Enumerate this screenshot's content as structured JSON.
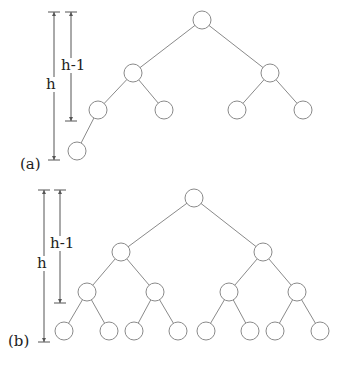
{
  "diagrams": [
    {
      "id": "a",
      "caption": "(a)",
      "height_label": "h",
      "height_minus_one_label": "h-1",
      "node_radius": 9,
      "nodes": [
        {
          "x": 202,
          "y": 20
        },
        {
          "x": 133,
          "y": 73
        },
        {
          "x": 270,
          "y": 73
        },
        {
          "x": 98,
          "y": 110
        },
        {
          "x": 164,
          "y": 110
        },
        {
          "x": 237,
          "y": 110
        },
        {
          "x": 303,
          "y": 110
        },
        {
          "x": 77,
          "y": 151
        }
      ],
      "edges": [
        [
          0,
          1
        ],
        [
          0,
          2
        ],
        [
          1,
          3
        ],
        [
          1,
          4
        ],
        [
          2,
          5
        ],
        [
          2,
          6
        ],
        [
          3,
          7
        ]
      ],
      "measure_h": {
        "x": 54,
        "y1": 12,
        "y2": 160
      },
      "measure_h1": {
        "x": 71,
        "y1": 12,
        "y2": 121
      },
      "caption_pos": {
        "x": 20,
        "y": 157
      },
      "h_label_pos": {
        "x": 46,
        "y": 77
      },
      "h1_label_pos": {
        "x": 61,
        "y": 58
      }
    },
    {
      "id": "b",
      "caption": "(b)",
      "height_label": "h",
      "height_minus_one_label": "h-1",
      "node_radius": 9,
      "nodes": [
        {
          "x": 194,
          "y": 198
        },
        {
          "x": 121,
          "y": 252
        },
        {
          "x": 263,
          "y": 252
        },
        {
          "x": 87,
          "y": 292
        },
        {
          "x": 155,
          "y": 292
        },
        {
          "x": 229,
          "y": 292
        },
        {
          "x": 297,
          "y": 292
        },
        {
          "x": 64,
          "y": 331
        },
        {
          "x": 109,
          "y": 331
        },
        {
          "x": 134,
          "y": 331
        },
        {
          "x": 178,
          "y": 331
        },
        {
          "x": 206,
          "y": 331
        },
        {
          "x": 250,
          "y": 331
        },
        {
          "x": 275,
          "y": 331
        },
        {
          "x": 320,
          "y": 331
        }
      ],
      "edges": [
        [
          0,
          1
        ],
        [
          0,
          2
        ],
        [
          1,
          3
        ],
        [
          1,
          4
        ],
        [
          2,
          5
        ],
        [
          2,
          6
        ],
        [
          3,
          7
        ],
        [
          3,
          8
        ],
        [
          4,
          9
        ],
        [
          4,
          10
        ],
        [
          5,
          11
        ],
        [
          5,
          12
        ],
        [
          6,
          13
        ],
        [
          6,
          14
        ]
      ],
      "measure_h": {
        "x": 44,
        "y1": 190,
        "y2": 342
      },
      "measure_h1": {
        "x": 60,
        "y1": 190,
        "y2": 303
      },
      "caption_pos": {
        "x": 8,
        "y": 334
      },
      "h_label_pos": {
        "x": 37,
        "y": 256
      },
      "h1_label_pos": {
        "x": 50,
        "y": 236
      }
    }
  ],
  "colors": {
    "stroke": "#8a8a8a",
    "node_fill": "#ffffff",
    "measure": "#555555",
    "text": "#222222"
  }
}
